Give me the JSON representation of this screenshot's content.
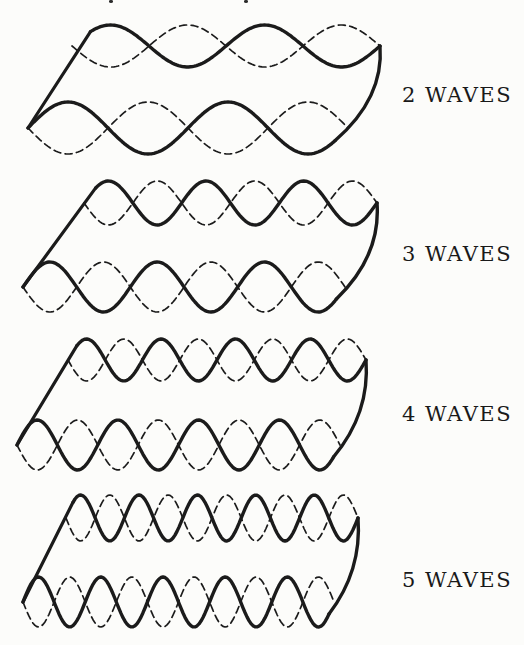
{
  "figure": {
    "rows": [
      {
        "label": "2 WAVES",
        "waves": 2
      },
      {
        "label": "3 WAVES",
        "waves": 3
      },
      {
        "label": "4 WAVES",
        "waves": 4
      },
      {
        "label": "5 WAVES",
        "waves": 5
      }
    ],
    "ink_color": "#1b1b1b",
    "paper_color": "#fcfcfa"
  }
}
